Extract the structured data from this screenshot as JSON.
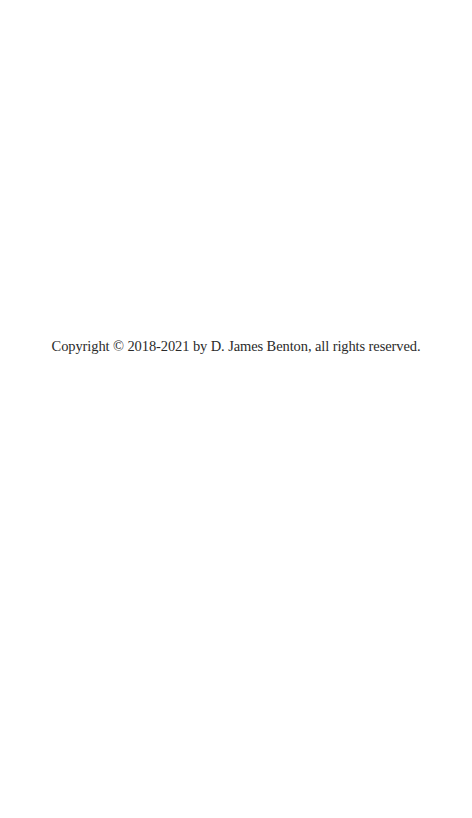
{
  "page": {
    "copyright_text": "Copyright © 2018-2021 by D. James Benton, all rights reserved."
  }
}
